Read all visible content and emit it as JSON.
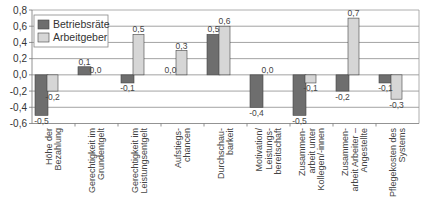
{
  "chart_data": {
    "type": "bar",
    "title": "",
    "xlabel": "",
    "ylabel": "",
    "ylim": [
      -0.6,
      0.8
    ],
    "yticks": [
      0.8,
      0.6,
      0.4,
      0.2,
      0.0,
      -0.2,
      -0.4,
      -0.6
    ],
    "ytick_labels": [
      "0,8",
      "0,6",
      "0,4",
      "0,2",
      "0,0",
      "-0,2",
      "-0,4",
      "-0,6"
    ],
    "grid": true,
    "legend_position": "upper-left-inside",
    "categories": [
      [
        "Höhe der",
        "Bezahlung"
      ],
      [
        "Gerechtigkeit im",
        "Grundentgelt"
      ],
      [
        "Gerechtigkeit im",
        "Leistungsentgelt"
      ],
      [
        "Aufstiegs-",
        "chancen"
      ],
      [
        "Durchschau-",
        "barkeit"
      ],
      [
        "Motivation/",
        "Leistungs-",
        "bereitschaft"
      ],
      [
        "Zusammen-",
        "arbeit unter",
        "Kollegen/-innen"
      ],
      [
        "Zusammen-",
        "arbeit Arbeiter –",
        "Angestellte"
      ],
      [
        "Pflegekosten des",
        "Systems"
      ]
    ],
    "series": [
      {
        "name": "Betriebsräte",
        "color": "#6e6e6e",
        "values": [
          -0.5,
          0.1,
          -0.1,
          0.0,
          0.5,
          -0.4,
          -0.5,
          -0.2,
          -0.1
        ],
        "labels": [
          "-0,5",
          "0,1",
          "-0,1",
          "0,0",
          "0,5",
          "-0,4",
          "-0,5",
          "-0,2",
          "-0,1"
        ]
      },
      {
        "name": "Arbeitgeber",
        "color": "#d6d6d6",
        "values": [
          -0.2,
          0.0,
          0.5,
          0.3,
          0.6,
          0.0,
          -0.1,
          0.7,
          -0.3
        ],
        "labels": [
          "-0,2",
          "0,0",
          "0,5",
          "0,3",
          "0,6",
          "0,0",
          "-0,1",
          "0,7",
          "-0,3"
        ]
      }
    ]
  },
  "colors": {
    "grid": "#8c8c8c",
    "axis": "#777777",
    "bar_stroke": "#444444",
    "frame": "#9a9a9a"
  }
}
